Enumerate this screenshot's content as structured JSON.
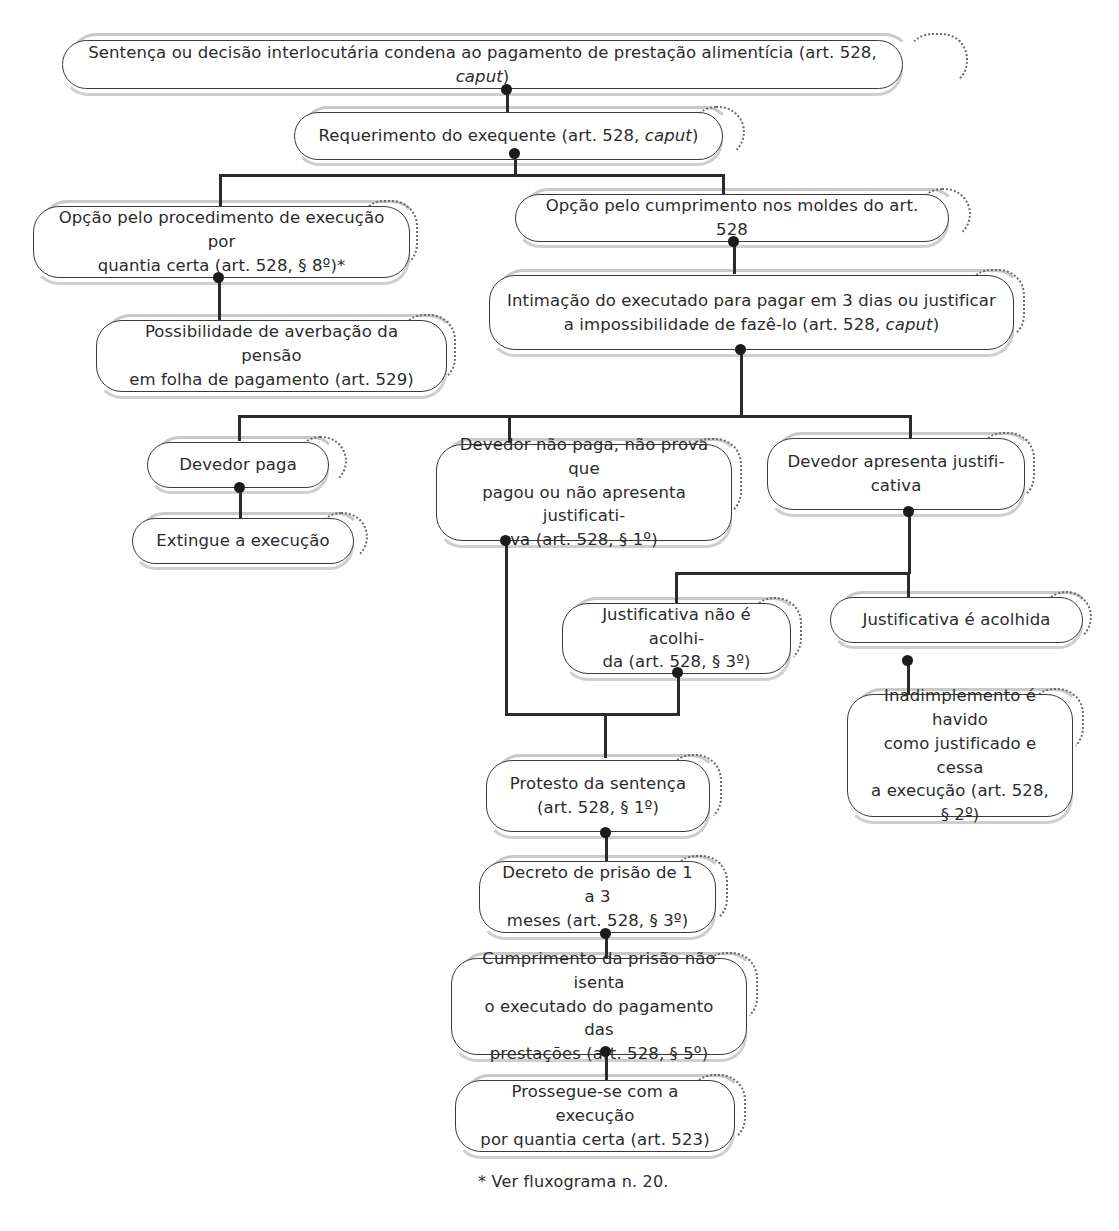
{
  "diagram": {
    "footnote": "* Ver fluxograma n. 20.",
    "colors": {
      "background": "#ffffff",
      "box_border": "#3a3a3a",
      "echo_outline": "#c9c9c9",
      "dotted_accent": "#6b6b6b",
      "connector": "#2b2b2b",
      "text": "#2b2b2b"
    }
  },
  "nodes": [
    {
      "id": "n1",
      "label": "Sentença ou decisão interlocutária condena ao pagamento de prestação alimentícia (art. 528, caput)",
      "line1": "Sentença ou decisão interlocutária condena ao pagamento de prestação alimentícia (art. 528, ",
      "italic1": "caput",
      "tail1": ")"
    },
    {
      "id": "n2",
      "label": "Requerimento do exequente (art. 528, caput)",
      "line1": "Requerimento do exequente (art. 528, ",
      "italic1": "caput",
      "tail1": ")"
    },
    {
      "id": "n3",
      "label": "Opção pelo procedimento de execução por quantia certa (art. 528, § 8º)*",
      "line1": "Opção pelo procedimento de execução por",
      "line2": "quantia certa (art. 528, § 8º)*"
    },
    {
      "id": "n4",
      "label": "Opção pelo cumprimento nos moldes do art. 528",
      "line1": "Opção pelo cumprimento nos moldes do art. 528"
    },
    {
      "id": "n5",
      "label": "Possibilidade de averbação da pensão em folha de pagamento (art. 529)",
      "line1": "Possibilidade de averbação da pensão",
      "line2": "em folha de pagamento (art. 529)"
    },
    {
      "id": "n6",
      "label": "Intimação do executado para pagar em 3 dias ou justificar a impossibilidade de fazê-lo (art. 528, caput)",
      "line1": "Intimação do executado para pagar em 3 dias ou  justificar",
      "line2": "a impossibilidade de fazê-lo (art. 528, ",
      "italic2": "caput",
      "tail2": ")"
    },
    {
      "id": "n7",
      "label": "Devedor paga",
      "line1": "Devedor paga"
    },
    {
      "id": "n8",
      "label": "Devedor não paga, não prova que pagou ou não apresenta justificativa (art. 528, § 1º)",
      "line1": "Devedor não paga, não prova que",
      "line2": "pagou ou não apresenta justificati-",
      "line3": "va (art. 528, § 1º)"
    },
    {
      "id": "n9",
      "label": "Devedor apresenta justificativa",
      "line1": "Devedor apresenta justifi-",
      "line2": "cativa"
    },
    {
      "id": "n10",
      "label": "Extingue a execução",
      "line1": "Extingue a execução"
    },
    {
      "id": "n11",
      "label": "Justificativa não é acolhida (art. 528, § 3º)",
      "line1": "Justificativa não é acolhi-",
      "line2": "da (art. 528, § 3º)"
    },
    {
      "id": "n12",
      "label": "Justificativa é acolhida",
      "line1": "Justificativa é acolhida"
    },
    {
      "id": "n13",
      "label": "Inadimplemento é havido como justificado e cessa a execução (art. 528, § 2º)",
      "line1": "Inadimplemento é havido",
      "line2": "como justificado e cessa",
      "line3": "a execução  (art. 528,",
      "line4": "§ 2º)"
    },
    {
      "id": "n14",
      "label": "Protesto da sentença (art. 528, § 1º)",
      "line1": "Protesto da sentença",
      "line2": "(art. 528, § 1º)"
    },
    {
      "id": "n15",
      "label": "Decreto de prisão de 1 a 3 meses (art. 528, § 3º)",
      "line1": "Decreto de prisão de 1 a 3",
      "line2": "meses (art. 528, § 3º)"
    },
    {
      "id": "n16",
      "label": "Cumprimento da prisão não isenta o executado do pagamento das prestações (art. 528, § 5º)",
      "line1": "Cumprimento da prisão não isenta",
      "line2": "o executado do pagamento das",
      "line3": "prestações (art. 528, § 5º)"
    },
    {
      "id": "n17",
      "label": "Prossegue-se com a execução por quantia certa (art. 523)",
      "line1": "Prossegue-se com a execução",
      "line2": "por quantia certa (art. 523)"
    }
  ],
  "edges": [
    {
      "from": "n1",
      "to": "n2",
      "type": "straight"
    },
    {
      "from": "n2",
      "to": "n3",
      "type": "branch"
    },
    {
      "from": "n2",
      "to": "n4",
      "type": "branch"
    },
    {
      "from": "n3",
      "to": "n5",
      "type": "straight"
    },
    {
      "from": "n4",
      "to": "n6",
      "type": "straight"
    },
    {
      "from": "n6",
      "to": "n7",
      "type": "branch"
    },
    {
      "from": "n6",
      "to": "n8",
      "type": "branch"
    },
    {
      "from": "n6",
      "to": "n9",
      "type": "branch"
    },
    {
      "from": "n7",
      "to": "n10",
      "type": "straight"
    },
    {
      "from": "n9",
      "to": "n11",
      "type": "branch"
    },
    {
      "from": "n9",
      "to": "n12",
      "type": "branch"
    },
    {
      "from": "n12",
      "to": "n13",
      "type": "straight"
    },
    {
      "from": "n8",
      "to": "n14",
      "type": "elbow"
    },
    {
      "from": "n11",
      "to": "n14",
      "type": "elbow"
    },
    {
      "from": "n14",
      "to": "n15",
      "type": "straight"
    },
    {
      "from": "n15",
      "to": "n16",
      "type": "straight"
    },
    {
      "from": "n16",
      "to": "n17",
      "type": "straight"
    }
  ]
}
